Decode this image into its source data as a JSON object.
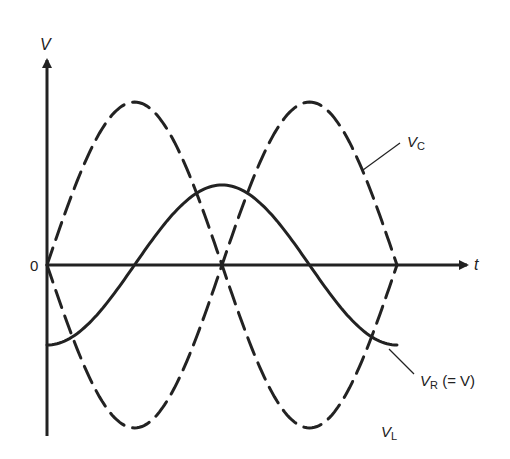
{
  "diagram": {
    "title": "",
    "type": "phasor-waveform",
    "axes": {
      "y_label": "V",
      "x_label": "t",
      "origin_label": "0"
    },
    "curves": [
      {
        "id": "vc",
        "label_main": "V",
        "label_sub": "C",
        "label_suffix": "",
        "style": "dashed",
        "shape": "sine",
        "amplitude": "large"
      },
      {
        "id": "vr",
        "label_main": "V",
        "label_sub": "R",
        "label_suffix": " (= V)",
        "style": "solid",
        "shape": "negative-cosine",
        "amplitude": "small"
      },
      {
        "id": "vl",
        "label_main": "V",
        "label_sub": "L",
        "label_suffix": "",
        "style": "dashed",
        "shape": "negative-sine",
        "amplitude": "large"
      }
    ],
    "colors": {
      "ink": "#222222",
      "background": "#ffffff"
    }
  },
  "labels": {
    "v_axis": "V",
    "t_axis": "t",
    "origin": "0",
    "vc_main": "V",
    "vc_sub": "C",
    "vr_main": "V",
    "vr_sub": "R",
    "vr_suffix": "(= V)",
    "vl_main": "V",
    "vl_sub": "L"
  }
}
